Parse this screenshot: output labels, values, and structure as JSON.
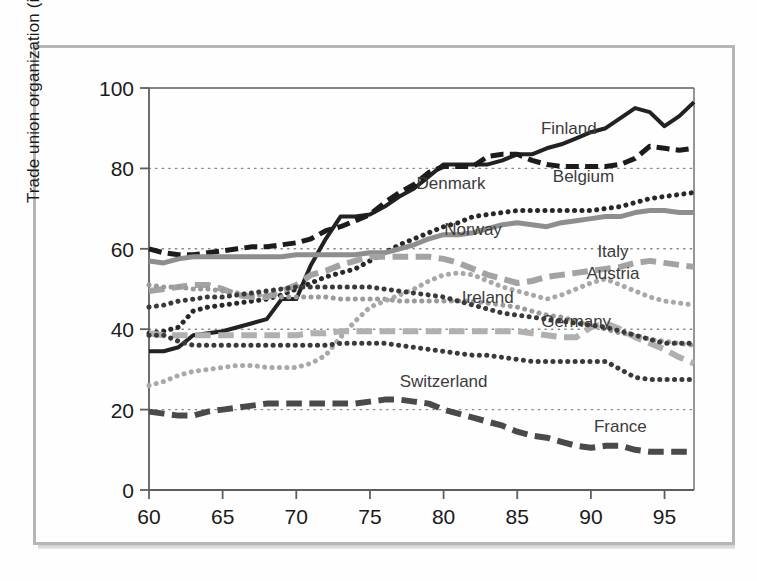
{
  "chart_data": {
    "type": "line",
    "title": "",
    "xlabel": "",
    "ylabel": "Trade union organization (in % of labour force)",
    "xlim": [
      60,
      97
    ],
    "ylim": [
      0,
      100
    ],
    "grid": "horizontal dotted at 20, 40, 60, 80",
    "legend_position": "inline right-hand series labels",
    "x_ticks": [
      "60",
      "65",
      "70",
      "75",
      "80",
      "85",
      "90",
      "95"
    ],
    "x_tick_values": [
      60,
      65,
      70,
      75,
      80,
      85,
      90,
      95
    ],
    "y_ticks": [
      "0",
      "20",
      "40",
      "60",
      "80",
      "100"
    ],
    "y_tick_values": [
      0,
      20,
      40,
      60,
      80,
      100
    ],
    "x": [
      60,
      61,
      62,
      63,
      64,
      65,
      66,
      67,
      68,
      69,
      70,
      71,
      72,
      73,
      74,
      75,
      76,
      77,
      78,
      79,
      80,
      81,
      82,
      83,
      84,
      85,
      86,
      87,
      88,
      89,
      90,
      91,
      92,
      93,
      94,
      95,
      96,
      97
    ],
    "series": [
      {
        "name": "Finland",
        "label": "Finland",
        "color": "#222222",
        "style": "solid",
        "width": 4,
        "label_x": 88.5,
        "label_y": 88.5,
        "values": [
          34.5,
          34.5,
          35.5,
          38.5,
          39.0,
          39.5,
          40.5,
          41.5,
          42.5,
          47.5,
          47.5,
          56.0,
          62.5,
          68.0,
          68.0,
          68.5,
          70.5,
          73.0,
          75.0,
          78.0,
          81.0,
          81.0,
          81.0,
          81.0,
          82.0,
          83.5,
          83.5,
          85.0,
          86.0,
          87.5,
          89.0,
          90.0,
          92.5,
          95.0,
          94.0,
          90.5,
          93.0,
          96.5
        ]
      },
      {
        "name": "Denmark",
        "label": "Denmark",
        "color": "#1c1c1c",
        "style": "dashed",
        "width": 5,
        "label_x": 80.5,
        "label_y": 75.0,
        "values": [
          60.0,
          59.0,
          58.5,
          58.5,
          59.0,
          59.5,
          60.0,
          60.5,
          60.5,
          61.0,
          61.5,
          62.5,
          64.5,
          65.5,
          67.0,
          68.5,
          71.5,
          74.0,
          76.0,
          79.0,
          80.5,
          80.5,
          80.5,
          83.0,
          83.5,
          83.5,
          82.0,
          81.0,
          80.5,
          80.5,
          80.5,
          80.5,
          81.0,
          82.5,
          85.5,
          85.0,
          84.5,
          85.0
        ]
      },
      {
        "name": "Belgium",
        "label": "Belgium",
        "color": "#282828",
        "style": "dotted",
        "width": 5,
        "label_x": 89.5,
        "label_y": 76.5,
        "values": [
          39.0,
          39.5,
          40.5,
          44.5,
          45.5,
          46.0,
          46.5,
          47.0,
          47.5,
          48.5,
          50.0,
          51.5,
          53.0,
          54.0,
          55.0,
          57.0,
          59.0,
          61.0,
          62.5,
          64.0,
          65.5,
          66.5,
          68.0,
          68.5,
          69.0,
          69.5,
          69.5,
          69.5,
          69.5,
          69.5,
          69.5,
          70.0,
          70.5,
          71.5,
          72.5,
          73.0,
          73.5,
          74.0
        ]
      },
      {
        "name": "Norway",
        "label": "Norway",
        "color": "#8e8e8e",
        "style": "solid",
        "width": 5,
        "label_x": 82.0,
        "label_y": 63.5,
        "values": [
          57.0,
          56.5,
          57.5,
          58.0,
          58.0,
          58.0,
          58.0,
          58.0,
          58.0,
          58.0,
          58.5,
          58.5,
          58.5,
          58.5,
          58.5,
          59.0,
          59.0,
          60.0,
          61.0,
          62.5,
          63.5,
          63.5,
          64.0,
          65.0,
          66.0,
          66.5,
          66.0,
          65.5,
          66.5,
          67.0,
          67.5,
          68.0,
          68.0,
          69.0,
          69.5,
          69.5,
          69.0,
          69.0
        ]
      },
      {
        "name": "Italy",
        "label": "Italy",
        "color": "#a3a3a3",
        "style": "dashed",
        "width": 6,
        "label_x": 91.5,
        "label_y": 58.0,
        "values": [
          49.5,
          50.0,
          50.5,
          51.0,
          51.0,
          50.0,
          48.5,
          48.0,
          48.0,
          49.5,
          51.0,
          53.5,
          54.5,
          56.0,
          57.0,
          58.0,
          58.0,
          58.0,
          58.0,
          58.0,
          57.5,
          56.5,
          55.0,
          53.5,
          52.5,
          51.5,
          52.0,
          53.0,
          53.5,
          54.0,
          54.5,
          55.0,
          55.5,
          56.5,
          57.0,
          56.5,
          56.0,
          55.5
        ]
      },
      {
        "name": "Austria",
        "label": "Austria",
        "color": "#9b9b9b",
        "style": "dotted",
        "width": 5,
        "label_x": 91.5,
        "label_y": 52.5,
        "values": [
          51.0,
          50.5,
          50.5,
          50.0,
          50.0,
          49.5,
          49.0,
          48.5,
          48.5,
          48.0,
          48.0,
          48.0,
          48.0,
          47.5,
          47.5,
          47.5,
          47.5,
          47.0,
          47.0,
          47.0,
          47.0,
          47.0,
          47.0,
          46.5,
          46.0,
          45.5,
          44.5,
          43.5,
          43.0,
          42.0,
          41.0,
          40.0,
          39.0,
          38.5,
          37.5,
          37.0,
          36.5,
          36.0
        ]
      },
      {
        "name": "Ireland",
        "label": "Ireland",
        "color": "#a8a8a8",
        "style": "dotted",
        "width": 5,
        "label_x": 83.0,
        "label_y": 46.5,
        "values": [
          26.0,
          27.0,
          28.5,
          29.5,
          30.0,
          30.5,
          31.0,
          31.0,
          30.5,
          30.5,
          30.5,
          31.5,
          33.5,
          38.0,
          42.0,
          45.5,
          47.0,
          48.5,
          50.0,
          52.0,
          53.5,
          54.0,
          53.5,
          52.0,
          50.5,
          49.5,
          48.5,
          47.5,
          48.5,
          50.0,
          51.5,
          52.5,
          51.0,
          49.5,
          48.0,
          47.0,
          46.5,
          46.0
        ]
      },
      {
        "name": "Germany",
        "label": "Germany",
        "color": "#b0b0b0",
        "style": "dashed",
        "width": 6,
        "label_x": 89.0,
        "label_y": 40.5,
        "values": [
          39.0,
          38.5,
          38.5,
          38.5,
          38.5,
          38.5,
          38.5,
          38.5,
          38.5,
          38.5,
          38.5,
          39.0,
          39.0,
          39.5,
          39.5,
          39.5,
          39.5,
          39.5,
          39.5,
          39.5,
          39.5,
          39.5,
          39.5,
          39.5,
          39.5,
          39.5,
          39.0,
          38.5,
          38.0,
          38.0,
          40.5,
          41.5,
          40.0,
          38.0,
          36.5,
          35.0,
          33.0,
          31.5
        ]
      },
      {
        "name": "Switzerland",
        "label": "Switzerland",
        "color": "#3a3a3a",
        "style": "dotted",
        "width": 5,
        "label_x": 80.0,
        "label_y": 25.5,
        "values": [
          45.5,
          46.0,
          47.0,
          47.5,
          48.0,
          48.0,
          48.5,
          49.0,
          49.5,
          50.0,
          50.5,
          50.5,
          50.5,
          50.5,
          50.5,
          50.5,
          50.0,
          49.5,
          49.0,
          48.5,
          48.0,
          47.0,
          46.0,
          45.0,
          44.0,
          43.5,
          43.0,
          42.5,
          42.0,
          41.5,
          41.0,
          40.5,
          39.5,
          38.5,
          37.5,
          36.5,
          36.5,
          36.5
        ]
      },
      {
        "name": "Switzerland-low",
        "label": "",
        "color": "#3a3a3a",
        "style": "dotted",
        "width": 5,
        "label_x": null,
        "label_y": null,
        "values": [
          38.5,
          38.5,
          37.0,
          36.0,
          36.0,
          36.0,
          36.0,
          36.0,
          36.0,
          36.0,
          36.0,
          36.0,
          36.0,
          36.5,
          36.5,
          36.5,
          36.5,
          36.0,
          35.5,
          35.0,
          34.5,
          34.0,
          33.5,
          33.5,
          33.0,
          32.5,
          32.0,
          32.0,
          32.0,
          32.0,
          32.0,
          32.0,
          30.0,
          28.0,
          27.5,
          27.5,
          27.5,
          27.5
        ]
      },
      {
        "name": "France",
        "label": "France",
        "color": "#4a4a4a",
        "style": "dashed",
        "width": 6,
        "label_x": 92.0,
        "label_y": 14.5,
        "values": [
          19.5,
          19.0,
          18.5,
          18.5,
          19.5,
          20.0,
          20.5,
          21.0,
          21.5,
          21.5,
          21.5,
          21.5,
          21.5,
          21.5,
          21.5,
          22.0,
          22.5,
          22.5,
          22.0,
          21.5,
          20.0,
          19.0,
          18.0,
          17.0,
          16.0,
          14.5,
          13.5,
          13.0,
          12.0,
          11.0,
          10.5,
          11.0,
          11.0,
          10.0,
          9.5,
          9.5,
          9.5,
          9.5
        ]
      }
    ]
  }
}
